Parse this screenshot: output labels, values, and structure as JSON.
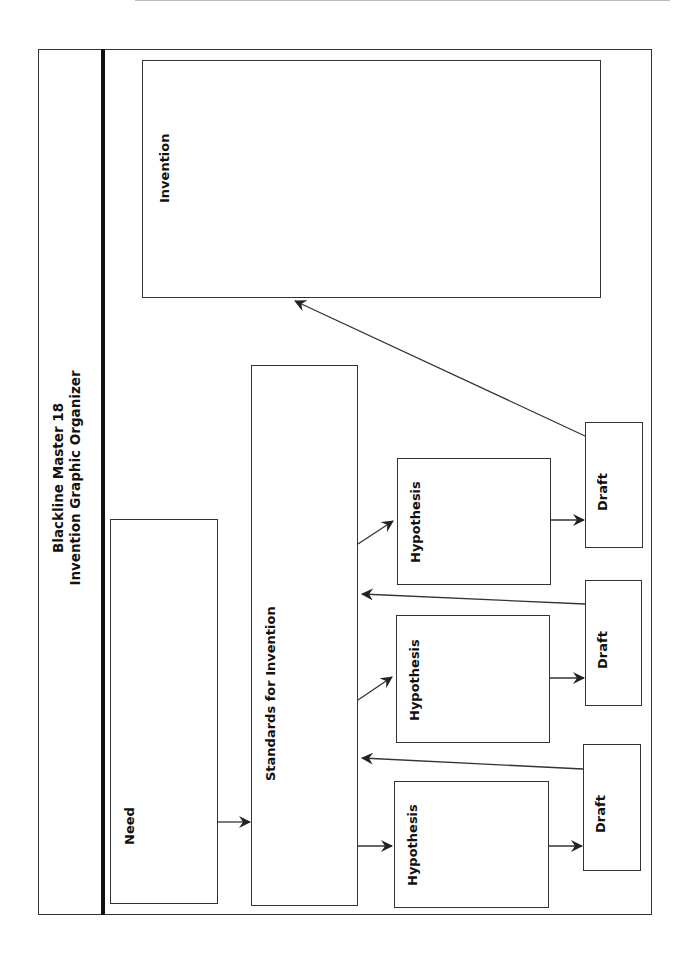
{
  "title": {
    "line1": "Blackline Master 18",
    "line2": "Invention Graphic Organizer"
  },
  "boxes": {
    "need": "Need",
    "standards": "Standards for Invention",
    "invention": "Invention",
    "hypotheses": [
      "Hypothesis",
      "Hypothesis",
      "Hypothesis"
    ],
    "drafts": [
      "Draft",
      "Draft",
      "Draft"
    ]
  },
  "colors": {
    "line": "#333333",
    "divider": "#111111",
    "background": "#ffffff"
  }
}
